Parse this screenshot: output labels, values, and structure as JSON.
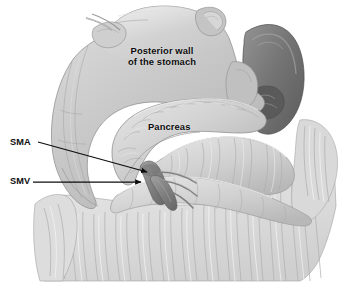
{
  "figure": {
    "type": "medical-anatomical-illustration",
    "background_color": "#ffffff",
    "width": 340,
    "height": 283
  },
  "labels": {
    "posterior_wall": {
      "line1": "Posterior wall",
      "line2": "of the stomach",
      "color": "#0d0d0d"
    },
    "pancreas": {
      "text": "Pancreas",
      "color": "#0d0d0d"
    },
    "sma": {
      "text": "SMA",
      "color": "#0d0d0d"
    },
    "smv": {
      "text": "SMV",
      "color": "#0d0d0d"
    }
  },
  "leader_lines": {
    "sma_arrow": {
      "from_x": 38,
      "from_y": 142,
      "to_x": 150,
      "to_y": 173,
      "color": "#0d0d0d"
    },
    "smv_arrow": {
      "from_x": 33,
      "from_y": 182,
      "to_x": 144,
      "to_y": 183,
      "color": "#0d0d0d"
    }
  },
  "structures": {
    "stomach": {
      "name": "posterior-wall-of-stomach",
      "fill": "#c6c6c6"
    },
    "pancreas": {
      "name": "pancreas",
      "fill": "#cfcfcf"
    },
    "spleen": {
      "name": "spleen",
      "fill": "#7b7b7b"
    },
    "transverse_colon": {
      "name": "transverse-colon",
      "fill": "#d2d2d2"
    },
    "greater_omentum": {
      "name": "greater-omentum",
      "fill": "#dedede"
    },
    "sma_vessel": {
      "name": "superior-mesenteric-artery",
      "fill": "#8c8c8c"
    },
    "smv_vessel": {
      "name": "superior-mesenteric-vein",
      "fill": "#969696"
    }
  }
}
